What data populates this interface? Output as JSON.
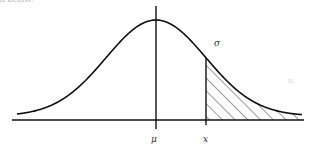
{
  "header_fragment": "a below:",
  "labels": {
    "mean": "μ",
    "x": "x",
    "sigma": "σ",
    "artifact": "n"
  },
  "colors": {
    "stroke": "#111111",
    "hatch": "#222222",
    "background": "#ffffff"
  },
  "chart_data": {
    "type": "area",
    "xlabel": "",
    "ylabel": "",
    "tick_labels": [
      "μ",
      "x"
    ],
    "annotations": [
      "σ"
    ],
    "shaded_region": "x to +∞ (upper tail, hatched)",
    "grid": false
  }
}
